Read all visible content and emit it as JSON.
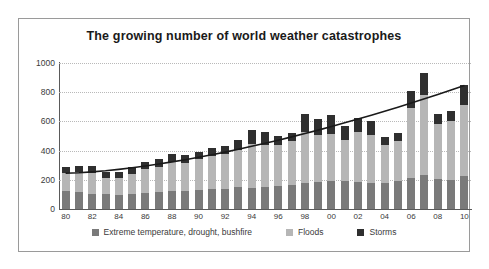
{
  "chart_data": {
    "type": "bar",
    "title": "The growing number of world weather catastrophes",
    "xlabel": "",
    "ylabel": "",
    "ylim": [
      0,
      1000
    ],
    "ytick_step": 200,
    "yticks": [
      "0",
      "200",
      "400",
      "600",
      "800",
      "1000"
    ],
    "grid": true,
    "stacked": true,
    "legend_position": "bottom",
    "categories": [
      "80",
      "81",
      "82",
      "83",
      "84",
      "85",
      "86",
      "87",
      "88",
      "89",
      "90",
      "91",
      "92",
      "93",
      "94",
      "95",
      "96",
      "97",
      "98",
      "99",
      "00",
      "01",
      "02",
      "03",
      "04",
      "05",
      "06",
      "07",
      "08",
      "09",
      "10"
    ],
    "xtick_labels_shown": [
      "80",
      "82",
      "84",
      "86",
      "88",
      "90",
      "92",
      "94",
      "96",
      "98",
      "00",
      "02",
      "04",
      "06",
      "08",
      "10"
    ],
    "series": [
      {
        "name": "Extreme temperature, drought, bushfire",
        "color": "#7a7a7a",
        "values": [
          120,
          115,
          105,
          100,
          95,
          105,
          110,
          115,
          125,
          120,
          130,
          135,
          140,
          150,
          145,
          150,
          160,
          165,
          175,
          185,
          195,
          190,
          185,
          180,
          175,
          195,
          215,
          235,
          205,
          200,
          225
        ]
      },
      {
        "name": "Floods",
        "color": "#b6b6b6",
        "values": [
          130,
          140,
          145,
          115,
          120,
          135,
          165,
          175,
          200,
          195,
          210,
          225,
          235,
          255,
          300,
          290,
          280,
          300,
          355,
          320,
          320,
          280,
          345,
          330,
          265,
          270,
          480,
          545,
          380,
          400,
          490
        ]
      },
      {
        "name": "Storms",
        "color": "#2f2f2f",
        "values": [
          40,
          40,
          45,
          40,
          40,
          45,
          50,
          50,
          55,
          55,
          50,
          55,
          60,
          70,
          95,
          90,
          60,
          55,
          120,
          115,
          130,
          100,
          95,
          90,
          55,
          55,
          115,
          150,
          65,
          70,
          135
        ]
      }
    ],
    "totals": [
      290,
      295,
      295,
      255,
      255,
      285,
      325,
      340,
      380,
      370,
      390,
      415,
      435,
      475,
      540,
      530,
      500,
      520,
      650,
      620,
      645,
      570,
      625,
      600,
      495,
      520,
      810,
      930,
      650,
      670,
      850
    ],
    "trendline": {
      "name": "trend",
      "color": "#1a1a1a",
      "start_value": 245,
      "end_value": 845
    }
  },
  "legend": {
    "items": [
      {
        "label": "Extreme temperature, drought, bushfire",
        "color": "#7a7a7a"
      },
      {
        "label": "Floods",
        "color": "#b6b6b6"
      },
      {
        "label": "Storms",
        "color": "#2f2f2f"
      }
    ]
  }
}
